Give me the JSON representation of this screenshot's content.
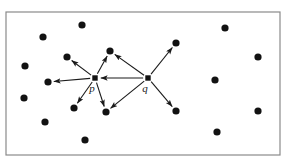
{
  "figure": {
    "background_color": "#ffffff",
    "frame": {
      "name": "bounding-rectangle",
      "x": 6,
      "y": 12,
      "width": 274,
      "height": 143,
      "stroke_color": "#8a8a8a",
      "stroke_width": 1.2,
      "fill": "none"
    },
    "style": {
      "dot_color": "#121212",
      "dot_radius": 3.6,
      "hub_size": 5.4,
      "edge_color": "#1a1a1a",
      "edge_width": 1.1,
      "arrowhead_color": "#1a1a1a"
    },
    "labels": [
      {
        "id": "label-p",
        "text": "p",
        "x": 92,
        "y": 92
      },
      {
        "id": "label-q",
        "text": "q",
        "x": 145,
        "y": 92
      }
    ],
    "hubs": [
      {
        "id": "p",
        "label": "p",
        "x": 95,
        "y": 78
      },
      {
        "id": "q",
        "label": "q",
        "x": 148,
        "y": 78
      }
    ],
    "points": [
      {
        "id": "d1",
        "x": 43,
        "y": 37
      },
      {
        "id": "d2",
        "x": 82,
        "y": 25
      },
      {
        "id": "d3",
        "x": 67,
        "y": 57
      },
      {
        "id": "d4",
        "x": 25,
        "y": 66
      },
      {
        "id": "d5",
        "x": 110,
        "y": 51
      },
      {
        "id": "d6",
        "x": 48,
        "y": 82
      },
      {
        "id": "d7",
        "x": 24,
        "y": 98
      },
      {
        "id": "d8",
        "x": 45,
        "y": 122
      },
      {
        "id": "d9",
        "x": 74,
        "y": 108
      },
      {
        "id": "d10",
        "x": 106,
        "y": 112
      },
      {
        "id": "d11",
        "x": 85,
        "y": 140
      },
      {
        "id": "d12",
        "x": 176,
        "y": 43
      },
      {
        "id": "d13",
        "x": 225,
        "y": 28
      },
      {
        "id": "d14",
        "x": 258,
        "y": 57
      },
      {
        "id": "d15",
        "x": 215,
        "y": 80
      },
      {
        "id": "d16",
        "x": 176,
        "y": 111
      },
      {
        "id": "d17",
        "x": 258,
        "y": 111
      },
      {
        "id": "d18",
        "x": 217,
        "y": 132
      }
    ],
    "edges": [
      {
        "id": "p-to-d3",
        "from": "p",
        "to": "d3",
        "from_x": 95,
        "from_y": 78,
        "to_x": 67,
        "to_y": 57
      },
      {
        "id": "p-to-d5",
        "from": "p",
        "to": "d5",
        "from_x": 95,
        "from_y": 78,
        "to_x": 110,
        "to_y": 51
      },
      {
        "id": "p-to-d6",
        "from": "p",
        "to": "d6",
        "from_x": 95,
        "from_y": 78,
        "to_x": 48,
        "to_y": 82
      },
      {
        "id": "p-to-d9",
        "from": "p",
        "to": "d9",
        "from_x": 95,
        "from_y": 78,
        "to_x": 74,
        "to_y": 108
      },
      {
        "id": "p-to-d10",
        "from": "p",
        "to": "d10",
        "from_x": 95,
        "from_y": 78,
        "to_x": 106,
        "to_y": 112
      },
      {
        "id": "q-to-p",
        "from": "q",
        "to": "p",
        "from_x": 148,
        "from_y": 78,
        "to_x": 95,
        "to_y": 78
      },
      {
        "id": "q-to-d5",
        "from": "q",
        "to": "d5",
        "from_x": 148,
        "from_y": 78,
        "to_x": 110,
        "to_y": 51
      },
      {
        "id": "q-to-d12",
        "from": "q",
        "to": "d12",
        "from_x": 148,
        "from_y": 78,
        "to_x": 176,
        "to_y": 43
      },
      {
        "id": "q-to-d10",
        "from": "q",
        "to": "d10",
        "from_x": 148,
        "from_y": 78,
        "to_x": 106,
        "to_y": 112
      },
      {
        "id": "q-to-d16",
        "from": "q",
        "to": "d16",
        "from_x": 148,
        "from_y": 78,
        "to_x": 176,
        "to_y": 111
      }
    ]
  }
}
